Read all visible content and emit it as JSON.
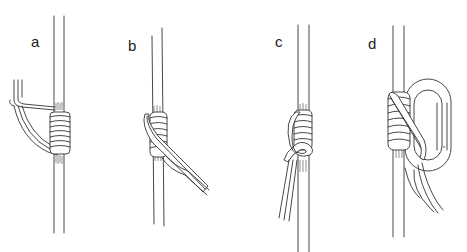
{
  "figure": {
    "type": "knot-tying step illustration",
    "panels": [
      {
        "id": "a",
        "label": "a",
        "description": "cord laid alongside main rope with coils wrapped around"
      },
      {
        "id": "b",
        "label": "b",
        "description": "coils wrapped on rope, tails exiting diagonally downward right"
      },
      {
        "id": "c",
        "label": "c",
        "description": "coils wrapped with tails tucked and hanging down left"
      },
      {
        "id": "d",
        "label": "d",
        "description": "wrapped coils clipped through a carabiner"
      }
    ]
  }
}
